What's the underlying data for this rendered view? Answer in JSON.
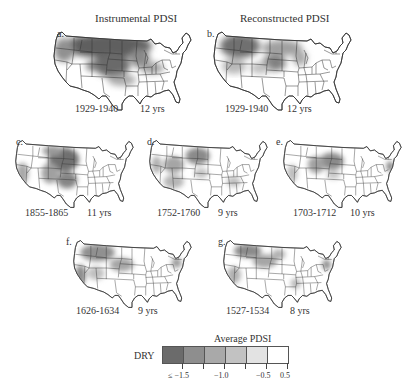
{
  "figure": {
    "column_titles": {
      "left": "Instrumental PDSI",
      "right": "Reconstructed PDSI"
    },
    "panels": [
      {
        "id": "a",
        "label": "a.",
        "period": "1929-1940",
        "duration": "12 yrs",
        "source": "Instrumental PDSI",
        "dry_regions": [
          {
            "name": "northern-plains-rockies",
            "shade": "#5e5e5e"
          },
          {
            "name": "central-plains",
            "shade": "#6a6a6a"
          },
          {
            "name": "upper-midwest",
            "shade": "#8a8a8a"
          },
          {
            "name": "pacific-northwest",
            "shade": "#909090"
          },
          {
            "name": "ohio-valley",
            "shade": "#a5a5a5"
          }
        ]
      },
      {
        "id": "b",
        "label": "b.",
        "period": "1929-1940",
        "duration": "12 yrs",
        "source": "Reconstructed PDSI",
        "dry_regions": [
          {
            "name": "northern-rockies",
            "shade": "#707070"
          },
          {
            "name": "central-plains",
            "shade": "#808080"
          },
          {
            "name": "upper-midwest",
            "shade": "#aaaaaa"
          },
          {
            "name": "great-basin",
            "shade": "#b8b8b8"
          }
        ]
      },
      {
        "id": "c",
        "label": "c.",
        "period": "1855-1865",
        "duration": "11 yrs",
        "dry_regions": [
          {
            "name": "central-plains",
            "shade": "#707070"
          },
          {
            "name": "southern-plains",
            "shade": "#858585"
          },
          {
            "name": "southwest",
            "shade": "#a0a0a0"
          },
          {
            "name": "california",
            "shade": "#a8a8a8"
          }
        ]
      },
      {
        "id": "d",
        "label": "d.",
        "period": "1752-1760",
        "duration": "9 yrs",
        "dry_regions": [
          {
            "name": "northern-plains",
            "shade": "#8a8a8a"
          },
          {
            "name": "great-basin",
            "shade": "#a5a5a5"
          },
          {
            "name": "southwest",
            "shade": "#b5b5b5"
          },
          {
            "name": "southeast",
            "shade": "#bdbdbd"
          }
        ]
      },
      {
        "id": "e",
        "label": "e.",
        "period": "1703-1712",
        "duration": "10 yrs",
        "dry_regions": [
          {
            "name": "central-plains",
            "shade": "#8a8a8a"
          },
          {
            "name": "colorado-utah",
            "shade": "#a0a0a0"
          },
          {
            "name": "california",
            "shade": "#bdbdbd"
          },
          {
            "name": "mid-atlantic",
            "shade": "#7a7a7a"
          }
        ]
      },
      {
        "id": "f",
        "label": "f.",
        "period": "1626-1634",
        "duration": "9 yrs",
        "dry_regions": [
          {
            "name": "northern-rockies",
            "shade": "#909090"
          },
          {
            "name": "central-plains",
            "shade": "#a5a5a5"
          },
          {
            "name": "california",
            "shade": "#8a8a8a"
          },
          {
            "name": "mid-atlantic",
            "shade": "#9a9a9a"
          }
        ]
      },
      {
        "id": "g",
        "label": "g.",
        "period": "1527-1534",
        "duration": "8 yrs",
        "dry_regions": [
          {
            "name": "northern-rockies",
            "shade": "#8a8a8a"
          },
          {
            "name": "great-basin",
            "shade": "#a5a5a5"
          },
          {
            "name": "california",
            "shade": "#b0b0b0"
          },
          {
            "name": "mid-atlantic",
            "shade": "#8a8a8a"
          },
          {
            "name": "lower-mississippi",
            "shade": "#b8b8b8"
          }
        ]
      }
    ],
    "legend": {
      "title": "Average PDSI",
      "side_label": "DRY",
      "swatches": [
        "#6b6b6b",
        "#8e8e8e",
        "#a9a9a9",
        "#c2c2c2",
        "#e3e3e3",
        "#ffffff"
      ],
      "tick_labels": [
        "≤ −1.5",
        "−1.0",
        "−0.5",
        "0.5"
      ]
    }
  }
}
